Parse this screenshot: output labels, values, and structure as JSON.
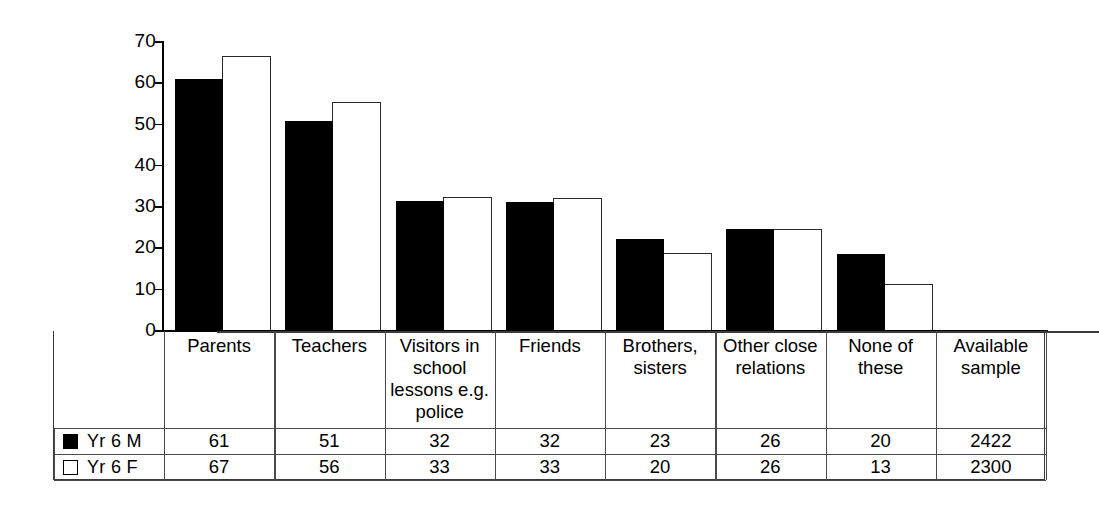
{
  "chart_data": {
    "type": "bar",
    "title": "",
    "xlabel": "",
    "ylabel": "",
    "ylim": [
      0,
      70
    ],
    "yticks": [
      "0",
      "10",
      "20",
      "30",
      "40",
      "50",
      "60",
      "70"
    ],
    "grid": false,
    "legend_position": "table-left",
    "categories": [
      "Parents",
      "Teachers",
      "Visitors in school lessons e.g. police",
      "Friends",
      "Brothers, sisters",
      "Other close relations",
      "None of these",
      "Available sample"
    ],
    "category_lines": [
      [
        "Parents"
      ],
      [
        "Teachers"
      ],
      [
        "Visitors in",
        "school",
        "lessons e.g.",
        "police"
      ],
      [
        "Friends"
      ],
      [
        "Brothers,",
        "sisters"
      ],
      [
        "Other close",
        "relations"
      ],
      [
        "None of these"
      ],
      [
        "Available",
        "sample"
      ]
    ],
    "series": [
      {
        "name": "Yr 6 M",
        "swatch": "filled-black",
        "values": [
          61,
          51,
          32,
          32,
          23,
          26,
          20,
          2422
        ]
      },
      {
        "name": "Yr 6 F",
        "swatch": "outline-white",
        "values": [
          67,
          56,
          33,
          33,
          20,
          26,
          13,
          2300
        ]
      }
    ],
    "plotted_values": {
      "note_excluded_last_column": true,
      "Yr 6 M": [
        61,
        50.8,
        31.5,
        31.2,
        22.2,
        24.8,
        18.6
      ],
      "Yr 6 F": [
        66.6,
        55.5,
        32.4,
        32.2,
        19,
        24.7,
        11.5
      ]
    }
  },
  "table": {
    "row_labels": [
      "Yr 6 M",
      "Yr 6 F"
    ],
    "rows": [
      [
        "61",
        "51",
        "32",
        "32",
        "23",
        "26",
        "20",
        "2422"
      ],
      [
        "67",
        "56",
        "33",
        "33",
        "20",
        "26",
        "13",
        "2300"
      ]
    ]
  },
  "colors": {
    "series_m": "#000000",
    "series_f": "#ffffff",
    "axis": "#000000",
    "grid_line": "#4a4a4a",
    "background": "#ffffff"
  }
}
